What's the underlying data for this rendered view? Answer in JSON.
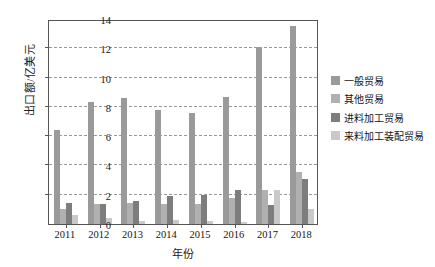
{
  "chart_data": {
    "type": "bar",
    "title": "",
    "xlabel": "年份",
    "ylabel": "出口额/亿美元",
    "categories": [
      "2011",
      "2012",
      "2013",
      "2014",
      "2015",
      "2016",
      "2017",
      "2018"
    ],
    "ylim": [
      0,
      14
    ],
    "yticks": [
      0,
      2,
      4,
      6,
      8,
      10,
      12,
      14
    ],
    "grid": true,
    "legend_position": "right",
    "series": [
      {
        "name": "一般贸易",
        "color": "#9a9a9a",
        "values": [
          6.4,
          8.35,
          8.6,
          7.8,
          7.55,
          8.7,
          12.1,
          13.5
        ]
      },
      {
        "name": "其他贸易",
        "color": "#b0b0b0",
        "values": [
          1.05,
          1.35,
          1.45,
          1.4,
          1.4,
          1.75,
          2.3,
          3.55
        ]
      },
      {
        "name": "进料加工贸易",
        "color": "#7d7d7d",
        "values": [
          1.45,
          1.4,
          1.6,
          1.9,
          1.95,
          2.3,
          1.3,
          3.1
        ]
      },
      {
        "name": "来料加工装配贸易",
        "color": "#c9c9c9",
        "values": [
          0.6,
          0.4,
          0.2,
          0.3,
          0.2,
          0.15,
          2.3,
          1.05
        ]
      }
    ]
  }
}
